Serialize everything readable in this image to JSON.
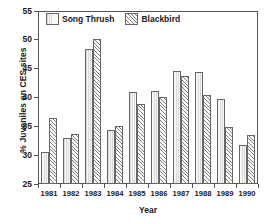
{
  "chart_data": {
    "type": "bar",
    "title": "",
    "subtitle": "",
    "xlabel": "Year",
    "ylabel": "% Juveniles on CES sites",
    "categories": [
      "1981",
      "1982",
      "1983",
      "1984",
      "1985",
      "1986",
      "1987",
      "1988",
      "1989",
      "1990"
    ],
    "series": [
      {
        "name": "Song Thrush",
        "pattern": "light-vertical-fill",
        "values": [
          30.5,
          32.9,
          48.4,
          34.3,
          41.0,
          41.2,
          44.6,
          44.4,
          39.8,
          31.7
        ]
      },
      {
        "name": "Blackbird",
        "pattern": "diagonal-hatch",
        "values": [
          36.5,
          33.7,
          50.1,
          35.0,
          38.9,
          40.1,
          43.8,
          40.4,
          34.9,
          33.5
        ]
      }
    ],
    "ylim": [
      25,
      55
    ],
    "ytick_values": [
      25,
      30,
      35,
      40,
      45,
      50,
      55
    ],
    "ytick_labels": [
      "25",
      "30",
      "35",
      "40",
      "45",
      "50",
      "55"
    ],
    "grid": false,
    "legend_position": "top-left-inside",
    "frame": true,
    "colors": {
      "axis": "#555555",
      "text": "#1a1a1a",
      "bar_outline": "#666666",
      "song_thrush_fill": "#f7f7f7",
      "blackbird_fill": "#fbfbfb",
      "background": "#ffffff"
    }
  },
  "legend": {
    "items": [
      {
        "label": "Song Thrush"
      },
      {
        "label": "Blackbird"
      }
    ]
  },
  "axes": {
    "x_title": "Year",
    "y_title": "% Juveniles on CES sites"
  }
}
